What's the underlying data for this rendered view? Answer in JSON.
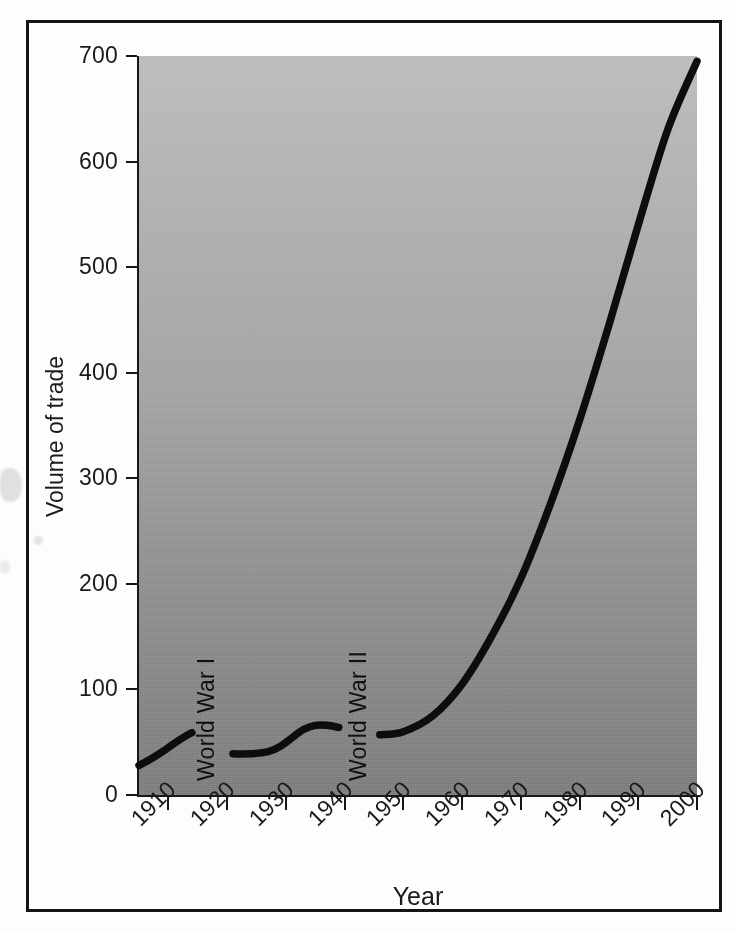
{
  "chart_data": {
    "type": "line",
    "title": "",
    "xlabel": "Year",
    "ylabel": "Volume of trade",
    "xlim": [
      1905,
      2000
    ],
    "ylim": [
      0,
      700
    ],
    "grid": false,
    "legend": null,
    "x_ticks": [
      "1910",
      "1920",
      "1930",
      "1940",
      "1950",
      "1960",
      "1970",
      "1980",
      "1990",
      "2000"
    ],
    "x_tick_values": [
      1910,
      1920,
      1930,
      1940,
      1950,
      1960,
      1970,
      1980,
      1990,
      2000
    ],
    "y_ticks": [
      "0",
      "100",
      "200",
      "300",
      "400",
      "500",
      "600",
      "700"
    ],
    "y_tick_values": [
      0,
      100,
      200,
      300,
      400,
      500,
      600,
      700
    ],
    "annotations": [
      {
        "text": "World War I",
        "x": 1916,
        "orientation": "vertical"
      },
      {
        "text": "World War II",
        "x": 1942,
        "orientation": "vertical"
      }
    ],
    "series": [
      {
        "name": "Volume of trade",
        "style": "solid-thick-black",
        "segments": [
          {
            "label": "pre-World-War-I",
            "x": [
              1905,
              1907,
              1909,
              1911,
              1913,
              1914
            ],
            "y": [
              28,
              34,
              41,
              49,
              56,
              59
            ]
          },
          {
            "label": "interwar",
            "x": [
              1921,
              1924,
              1927,
              1929,
              1931,
              1933,
              1935,
              1937,
              1939
            ],
            "y": [
              39,
              39,
              41,
              46,
              54,
              62,
              66,
              66,
              64
            ]
          },
          {
            "label": "post-World-War-II",
            "x": [
              1946,
              1950,
              1955,
              1960,
              1965,
              1970,
              1975,
              1980,
              1985,
              1990,
              1995,
              2000
            ],
            "y": [
              57,
              60,
              75,
              105,
              150,
              205,
              275,
              355,
              445,
              540,
              630,
              695
            ]
          }
        ]
      }
    ]
  },
  "figure": {
    "frame_color": "#141414",
    "plot_fill_top": "#bdbdbd",
    "plot_fill_bottom": "#7e7e7e",
    "curve_color": "#0d0d0d",
    "text_color": "#1a1a1a"
  }
}
